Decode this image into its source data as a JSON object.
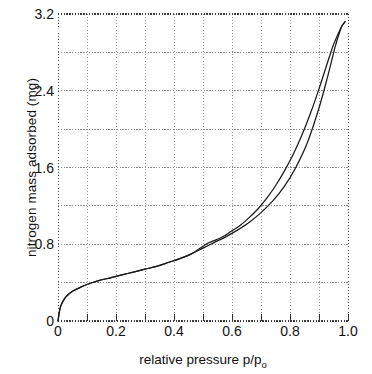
{
  "chart_data": {
    "type": "line",
    "title": "",
    "xlabel": "relative pressure p/p",
    "xlabel_sub": "o",
    "ylabel": "nitrogen mass adsorbed (mg)",
    "xlim": [
      0,
      1.0
    ],
    "ylim": [
      0,
      3.2
    ],
    "xticks": [
      "0",
      "0.2",
      "0.4",
      "0.6",
      "0.8",
      "1.0"
    ],
    "xtick_values": [
      0,
      0.2,
      0.4,
      0.6,
      0.8,
      1.0
    ],
    "yticks": [
      "0",
      "0.8",
      "1.6",
      "2.4",
      "3.2"
    ],
    "ytick_values": [
      0,
      0.8,
      1.6,
      2.4,
      3.2
    ],
    "grid": true,
    "grid_style": "dotted",
    "grid_color": "#8a8a8a",
    "x_minor_step": 0.1,
    "y_minor_step": 0.4,
    "legend": "none",
    "line_color": "#1a1a1a",
    "series": [
      {
        "name": "adsorption",
        "x": [
          0.0,
          0.005,
          0.01,
          0.02,
          0.03,
          0.05,
          0.07,
          0.1,
          0.14,
          0.18,
          0.22,
          0.26,
          0.3,
          0.34,
          0.38,
          0.42,
          0.46,
          0.5,
          0.54,
          0.58,
          0.62,
          0.66,
          0.7,
          0.74,
          0.78,
          0.82,
          0.86,
          0.9,
          0.93,
          0.955,
          0.97,
          0.98,
          0.99
        ],
        "values": [
          0.0,
          0.1,
          0.16,
          0.22,
          0.26,
          0.31,
          0.34,
          0.38,
          0.42,
          0.45,
          0.48,
          0.51,
          0.54,
          0.57,
          0.61,
          0.65,
          0.7,
          0.76,
          0.82,
          0.88,
          0.95,
          1.03,
          1.13,
          1.25,
          1.4,
          1.6,
          1.86,
          2.22,
          2.55,
          2.85,
          3.0,
          3.08,
          3.12
        ]
      },
      {
        "name": "desorption",
        "x": [
          0.99,
          0.98,
          0.97,
          0.95,
          0.93,
          0.9,
          0.87,
          0.84,
          0.81,
          0.78,
          0.75,
          0.72,
          0.69,
          0.66,
          0.63,
          0.6,
          0.57,
          0.545,
          0.52,
          0.5,
          0.46,
          0.42,
          0.38,
          0.34,
          0.3,
          0.26,
          0.22,
          0.18,
          0.14,
          0.1,
          0.07,
          0.05,
          0.03,
          0.02,
          0.01,
          0.005,
          0.0
        ],
        "values": [
          3.12,
          3.08,
          3.02,
          2.88,
          2.7,
          2.42,
          2.16,
          1.93,
          1.73,
          1.56,
          1.41,
          1.28,
          1.17,
          1.08,
          1.0,
          0.94,
          0.88,
          0.845,
          0.815,
          0.78,
          0.7,
          0.65,
          0.61,
          0.57,
          0.54,
          0.51,
          0.48,
          0.45,
          0.42,
          0.38,
          0.34,
          0.31,
          0.26,
          0.22,
          0.16,
          0.1,
          0.0
        ]
      }
    ],
    "hysteresis_closure_low": 0.49,
    "hysteresis_closure_high": 0.99,
    "annotations": []
  },
  "caption": {
    "text": ""
  }
}
